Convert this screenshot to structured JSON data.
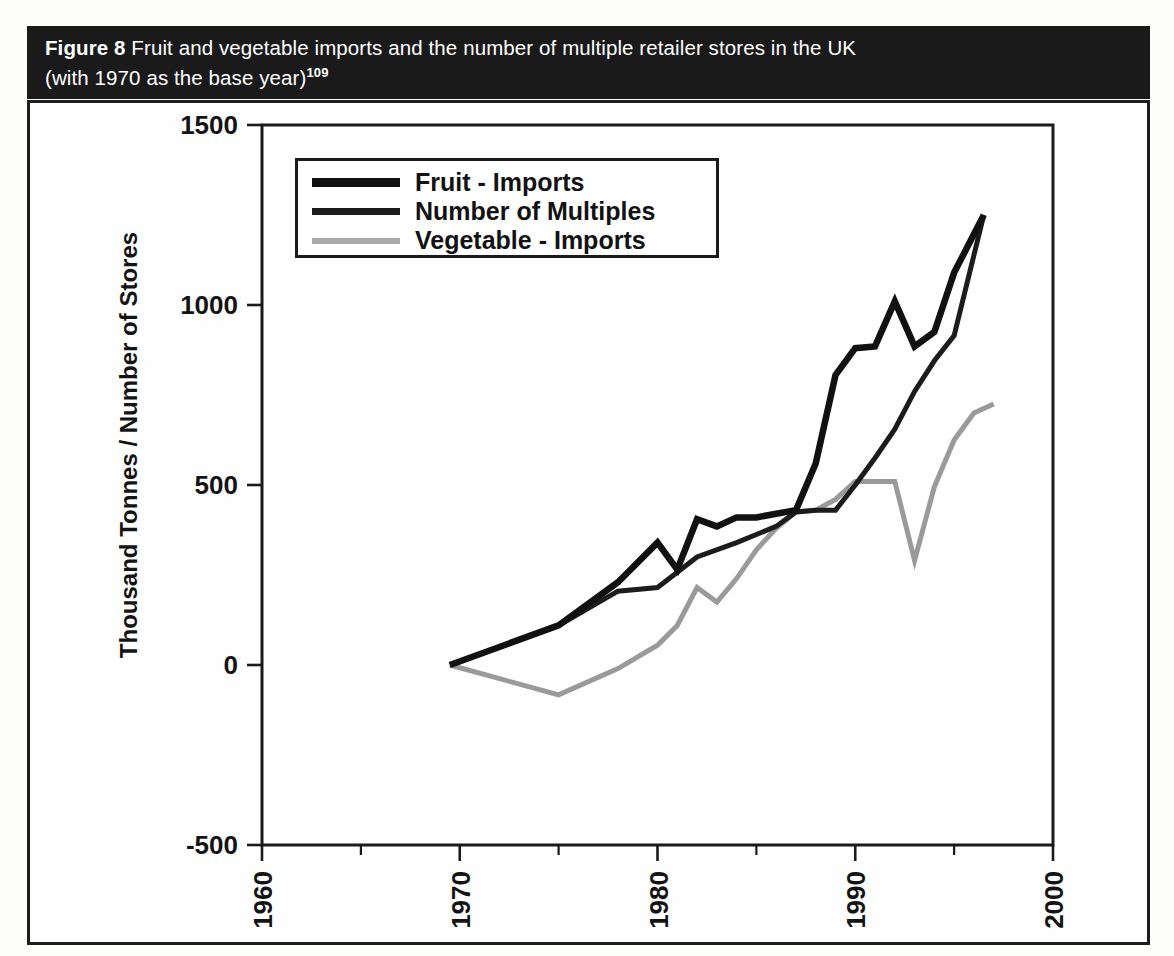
{
  "figure": {
    "number_label": "Figure 8",
    "caption_line1": " Fruit and vegetable imports and the number of multiple retailer stores in the UK",
    "caption_line2": "(with 1970 as the base year)",
    "caption_superscript": "109"
  },
  "chart_data": {
    "type": "line",
    "title": "Fruit and vegetable imports and the number of multiple retailer stores in the UK (with 1970 as the base year)",
    "xlabel": "",
    "ylabel": "Thousand Tonnes / Number of Stores",
    "xlim": [
      1960,
      2000
    ],
    "ylim": [
      -500,
      1500
    ],
    "grid": false,
    "legend_position": "top-left-inside",
    "x_ticks": [
      1960,
      1970,
      1980,
      1990,
      2000
    ],
    "x_tick_labels": [
      "1960",
      "1970",
      "1980",
      "1990",
      "2000"
    ],
    "x_minor_ticks": [
      1965,
      1975,
      1985,
      1995
    ],
    "y_ticks": [
      -500,
      0,
      500,
      1000,
      1500
    ],
    "y_tick_labels": [
      "-500",
      "0",
      "500",
      "1000",
      "1500"
    ],
    "series": [
      {
        "name": "Fruit - Imports",
        "color": "#111111",
        "width": 6.5,
        "x": [
          1969.5,
          1975,
          1978,
          1980,
          1981,
          1982,
          1983,
          1984,
          1985,
          1986,
          1987,
          1988,
          1989,
          1990,
          1991,
          1992,
          1993,
          1994,
          1995,
          1996.5
        ],
        "y": [
          0,
          110,
          230,
          340,
          265,
          405,
          385,
          410,
          410,
          420,
          430,
          560,
          805,
          880,
          885,
          1010,
          885,
          925,
          1090,
          1250
        ]
      },
      {
        "name": "Number of Multiples",
        "color": "#1c1c1c",
        "width": 5.0,
        "x": [
          1969.5,
          1975,
          1978,
          1980,
          1982,
          1984,
          1986,
          1987,
          1988,
          1989,
          1990,
          1991,
          1992,
          1993,
          1994,
          1995,
          1996.5
        ],
        "y": [
          0,
          110,
          205,
          215,
          300,
          340,
          385,
          425,
          430,
          430,
          500,
          575,
          655,
          760,
          845,
          915,
          1250
        ]
      },
      {
        "name": "Vegetable - Imports",
        "color": "#9a9a9a",
        "width": 5.0,
        "x": [
          1969.5,
          1975,
          1978,
          1980,
          1981,
          1982,
          1983,
          1984,
          1985,
          1986,
          1987,
          1988,
          1989,
          1990,
          1991,
          1992,
          1993,
          1994,
          1995,
          1996,
          1997
        ],
        "y": [
          0,
          -83,
          -10,
          55,
          110,
          215,
          175,
          240,
          320,
          380,
          425,
          430,
          460,
          510,
          510,
          510,
          290,
          495,
          625,
          700,
          725
        ]
      }
    ]
  },
  "legend": {
    "items": [
      {
        "label": "Fruit - Imports",
        "color": "#111111",
        "thickness": 9
      },
      {
        "label": "Number of Multiples",
        "color": "#1c1c1c",
        "thickness": 7
      },
      {
        "label": "Vegetable - Imports",
        "color": "#a9a9a9",
        "thickness": 6
      }
    ]
  }
}
